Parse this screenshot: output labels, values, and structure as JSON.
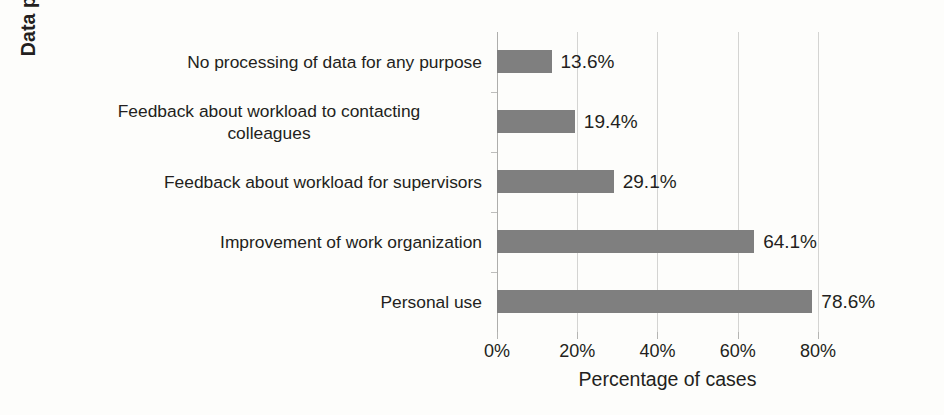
{
  "chart_data": {
    "type": "bar",
    "orientation": "horizontal",
    "title": "",
    "xlabel": "Percentage of cases",
    "ylabel": "Data processing purpose",
    "categories": [
      "No processing of data for any purpose",
      "Feedback about workload to contacting colleagues",
      "Feedback about workload for supervisors",
      "Improvement of work organization",
      "Personal use"
    ],
    "category_lines": [
      [
        "No processing of data for any purpose"
      ],
      [
        "Feedback about workload to contacting",
        "colleagues"
      ],
      [
        "Feedback about workload for supervisors"
      ],
      [
        "Improvement of work organization"
      ],
      [
        "Personal use"
      ]
    ],
    "values": [
      13.6,
      19.4,
      29.1,
      64.1,
      78.6
    ],
    "value_labels": [
      "13.6%",
      "19.4%",
      "29.1%",
      "64.1%",
      "78.6%"
    ],
    "xlim": [
      0,
      85
    ],
    "xticks": [
      0,
      20,
      40,
      60,
      80
    ],
    "xtick_labels": [
      "0%",
      "20%",
      "40%",
      "60%",
      "80%"
    ],
    "grid": true,
    "grid_axis": "x",
    "legend": false,
    "bar_color": "#7f7f7f",
    "text_color": "#231f20",
    "gridline_color": "#d4d4d2",
    "background_color": "#fdfdfb"
  }
}
